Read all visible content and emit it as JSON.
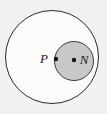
{
  "figure": {
    "background_color": "#f2f1ef",
    "outline_color": "#2b2b2b",
    "shade_color": "#c8c8c8",
    "dot_color": "#141414",
    "label_color": "#1a1a1a",
    "outer_circle": {
      "name": "outer-circle",
      "cx": 52,
      "cy": 57,
      "r": 46.5,
      "fill": "#fbfbfa",
      "stroke": "#2b2b2b",
      "stroke_width": 1
    },
    "shaded_circle": {
      "name": "shaded-circle",
      "cx": 74,
      "cy": 61,
      "r": 19.5,
      "fill": "#c8c8c8",
      "stroke": "#3a3a3a",
      "stroke_width": 1
    },
    "points": [
      {
        "id": "P",
        "label": "P",
        "dot_x": 56,
        "dot_y": 59,
        "dot_r": 2.2,
        "label_x": 44,
        "label_y": 63,
        "label_anchor": "middle"
      },
      {
        "id": "N",
        "label": "N",
        "dot_x": 74,
        "dot_y": 60,
        "dot_r": 2.2,
        "label_x": 84,
        "label_y": 64,
        "label_anchor": "middle"
      }
    ]
  }
}
